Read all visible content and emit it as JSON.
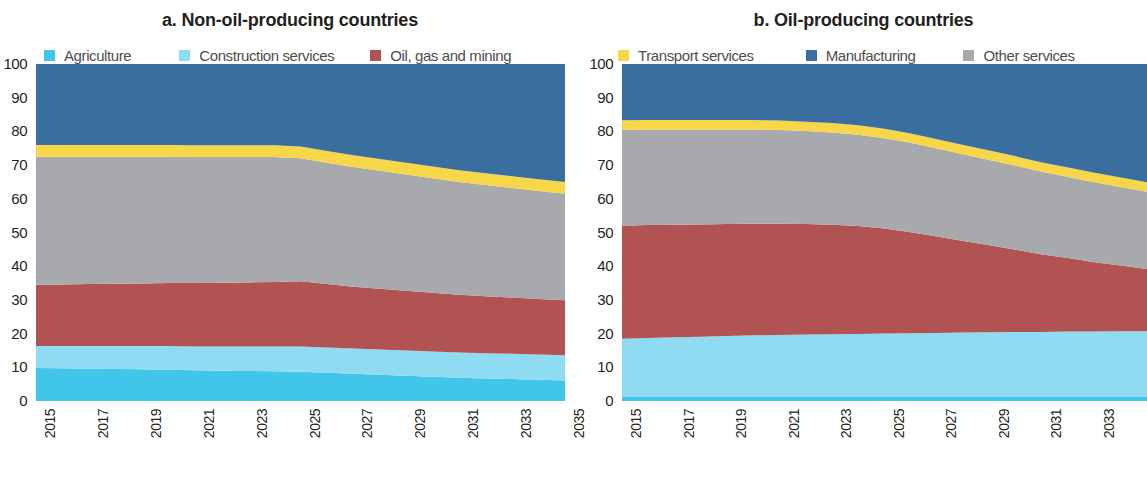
{
  "figure": {
    "panels": [
      {
        "id": "a",
        "title": "a. Non-oil-producing countries",
        "legend": [
          {
            "label": "Agriculture",
            "color": "#41c6ea",
            "name": "agriculture"
          },
          {
            "label": "Construction services",
            "color": "#8fdcf2",
            "name": "construction-services"
          },
          {
            "label": "Oil, gas and mining",
            "color": "#b05352",
            "name": "oil-gas-and-mining"
          }
        ]
      },
      {
        "id": "b",
        "title": "b. Oil-producing countries",
        "legend": [
          {
            "label": "Transport services",
            "color": "#f7d747",
            "name": "transport-services"
          },
          {
            "label": "Manufacturing",
            "color": "#3a6e9e",
            "name": "manufacturing"
          },
          {
            "label": "Other services",
            "color": "#a7a9ac",
            "name": "other-services"
          }
        ]
      }
    ]
  },
  "chart_data": [
    {
      "type": "area",
      "stacked": true,
      "normalized": true,
      "title": "a. Non-oil-producing countries",
      "xlabel": "",
      "ylabel": "",
      "ylim": [
        0,
        100
      ],
      "yticks": [
        0,
        10,
        20,
        30,
        40,
        50,
        60,
        70,
        80,
        90,
        100
      ],
      "grid": false,
      "legend_position": "top",
      "x": [
        2015,
        2016,
        2017,
        2018,
        2019,
        2020,
        2021,
        2022,
        2023,
        2024,
        2025,
        2026,
        2027,
        2028,
        2029,
        2030,
        2031,
        2032,
        2033,
        2034,
        2035
      ],
      "xticks": [
        2015,
        2017,
        2019,
        2021,
        2023,
        2025,
        2027,
        2029,
        2031,
        2033,
        2035
      ],
      "series": [
        {
          "name": "Agriculture",
          "color": "#41c6ea",
          "values": [
            9.8,
            9.7,
            9.6,
            9.5,
            9.4,
            9.3,
            9.1,
            9.0,
            8.9,
            8.8,
            8.7,
            8.4,
            8.1,
            7.8,
            7.5,
            7.2,
            6.9,
            6.7,
            6.5,
            6.3,
            6.1
          ]
        },
        {
          "name": "Construction services",
          "color": "#8fdcf2",
          "values": [
            6.5,
            6.6,
            6.7,
            6.8,
            6.9,
            7.0,
            7.1,
            7.2,
            7.3,
            7.4,
            7.5,
            7.5,
            7.5,
            7.5,
            7.5,
            7.5,
            7.5,
            7.5,
            7.5,
            7.5,
            7.5
          ]
        },
        {
          "name": "Oil, gas and mining",
          "color": "#b05352",
          "values": [
            18.2,
            18.3,
            18.4,
            18.5,
            18.6,
            18.7,
            18.8,
            18.9,
            19.0,
            19.1,
            19.3,
            18.8,
            18.3,
            18.0,
            17.7,
            17.4,
            17.1,
            16.9,
            16.7,
            16.5,
            16.3
          ]
        },
        {
          "name": "Other services",
          "color": "#a7a9ac",
          "values": [
            38.0,
            37.9,
            37.8,
            37.7,
            37.6,
            37.5,
            37.4,
            37.3,
            37.2,
            37.1,
            36.5,
            36.0,
            35.5,
            35.0,
            34.5,
            34.0,
            33.5,
            33.0,
            32.5,
            32.0,
            31.6
          ]
        },
        {
          "name": "Transport services",
          "color": "#f7d747",
          "values": [
            3.5,
            3.5,
            3.5,
            3.5,
            3.5,
            3.5,
            3.5,
            3.5,
            3.5,
            3.5,
            3.5,
            3.5,
            3.5,
            3.5,
            3.5,
            3.5,
            3.5,
            3.5,
            3.5,
            3.5,
            3.5
          ]
        },
        {
          "name": "Manufacturing",
          "color": "#3a6e9e",
          "values": [
            24.0,
            24.0,
            24.0,
            24.0,
            24.0,
            24.0,
            24.1,
            24.1,
            24.1,
            24.1,
            24.5,
            25.8,
            27.1,
            28.2,
            29.3,
            30.4,
            31.5,
            32.4,
            33.3,
            34.2,
            35.0
          ]
        }
      ]
    },
    {
      "type": "area",
      "stacked": true,
      "normalized": true,
      "title": "b. Oil-producing countries",
      "xlabel": "",
      "ylabel": "",
      "ylim": [
        0,
        100
      ],
      "yticks": [
        0,
        10,
        20,
        30,
        40,
        50,
        60,
        70,
        80,
        90,
        100
      ],
      "grid": false,
      "legend_position": "top",
      "x": [
        2015,
        2016,
        2017,
        2018,
        2019,
        2020,
        2021,
        2022,
        2023,
        2024,
        2025,
        2026,
        2027,
        2028,
        2029,
        2030,
        2031,
        2032,
        2033,
        2034,
        2035
      ],
      "xticks": [
        2015,
        2017,
        2019,
        2021,
        2023,
        2025,
        2027,
        2029,
        2031,
        2033,
        2035
      ],
      "series": [
        {
          "name": "Agriculture",
          "color": "#41c6ea",
          "values": [
            1.2,
            1.2,
            1.2,
            1.2,
            1.2,
            1.2,
            1.2,
            1.2,
            1.2,
            1.2,
            1.2,
            1.2,
            1.2,
            1.2,
            1.2,
            1.2,
            1.2,
            1.2,
            1.2,
            1.2,
            1.2
          ]
        },
        {
          "name": "Construction services",
          "color": "#8fdcf2",
          "values": [
            17.3,
            17.5,
            17.7,
            17.9,
            18.1,
            18.3,
            18.4,
            18.5,
            18.6,
            18.7,
            18.8,
            18.9,
            19.0,
            19.1,
            19.2,
            19.3,
            19.3,
            19.4,
            19.4,
            19.5,
            19.5
          ]
        },
        {
          "name": "Oil, gas and mining",
          "color": "#b05352",
          "values": [
            33.5,
            33.5,
            33.4,
            33.3,
            33.2,
            33.1,
            33.0,
            32.8,
            32.5,
            32.0,
            31.2,
            30.0,
            28.6,
            27.2,
            25.8,
            24.4,
            23.0,
            21.8,
            20.6,
            19.5,
            18.5
          ]
        },
        {
          "name": "Other services",
          "color": "#a7a9ac",
          "values": [
            28.5,
            28.4,
            28.3,
            28.2,
            28.1,
            28.0,
            27.8,
            27.6,
            27.4,
            27.1,
            26.8,
            26.5,
            26.1,
            25.7,
            25.3,
            24.9,
            24.5,
            24.1,
            23.7,
            23.3,
            22.9
          ]
        },
        {
          "name": "Transport services",
          "color": "#f7d747",
          "values": [
            2.8,
            2.8,
            2.8,
            2.8,
            2.8,
            2.8,
            2.8,
            2.8,
            2.8,
            2.8,
            2.8,
            2.8,
            2.8,
            2.8,
            2.8,
            2.8,
            2.8,
            2.8,
            2.8,
            2.8,
            2.8
          ]
        },
        {
          "name": "Manufacturing",
          "color": "#3a6e9e",
          "values": [
            16.7,
            16.6,
            16.6,
            16.6,
            16.6,
            16.6,
            16.8,
            17.1,
            17.5,
            18.2,
            19.2,
            20.6,
            22.3,
            24.0,
            25.7,
            27.4,
            29.2,
            30.7,
            32.3,
            33.7,
            35.1
          ]
        }
      ]
    }
  ]
}
